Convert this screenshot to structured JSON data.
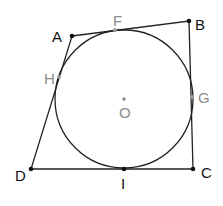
{
  "diagram": {
    "type": "tangential quadrilateral with inscribed circle",
    "colors": {
      "line": "#222222",
      "vertex": "#111111",
      "tangent_point": "#9a9a9a",
      "label_gray": "#8c8c8c"
    },
    "circle": {
      "center": "O",
      "cx": 124,
      "cy": 99,
      "r": 69
    },
    "vertices": [
      {
        "name": "A",
        "x": 72,
        "y": 36,
        "label": "A"
      },
      {
        "name": "B",
        "x": 189,
        "y": 21,
        "label": "B"
      },
      {
        "name": "C",
        "x": 193,
        "y": 169,
        "label": "C"
      },
      {
        "name": "D",
        "x": 31,
        "y": 169,
        "label": "D"
      }
    ],
    "tangent_points": [
      {
        "name": "F",
        "x": 115,
        "y": 30,
        "label": "F",
        "side": "AB"
      },
      {
        "name": "G",
        "x": 192,
        "y": 97,
        "label": "G",
        "side": "BC"
      },
      {
        "name": "H",
        "x": 59,
        "y": 77,
        "label": "H",
        "side": "DA"
      },
      {
        "name": "I",
        "x": 124,
        "y": 169,
        "label": "I",
        "side": "CD"
      }
    ],
    "center_label": "O"
  }
}
